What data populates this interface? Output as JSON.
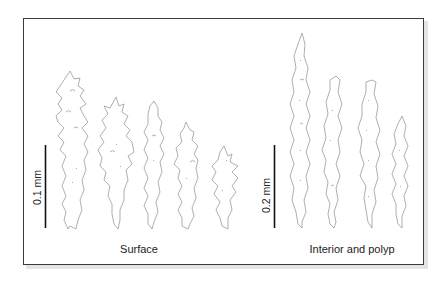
{
  "figure": {
    "frame_color": "#3a3a3a",
    "outline_color": "#9a9a9a",
    "groups": [
      {
        "label": "Surface",
        "scale_bar": {
          "label": "0.1 mm"
        },
        "sclerite_count": 5
      },
      {
        "label": "Interior and polyp",
        "scale_bar": {
          "label": "0.2 mm"
        },
        "sclerite_count": 4
      }
    ]
  }
}
